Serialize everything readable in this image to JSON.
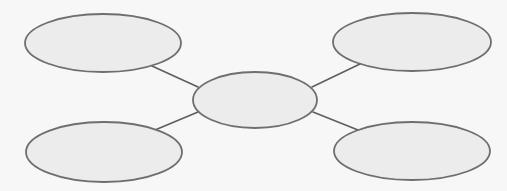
{
  "diagram": {
    "type": "spider-map",
    "colors": {
      "background": "#f7f7f7",
      "node_fill": "#ececec",
      "node_stroke": "#6e6e6e",
      "edge_stroke": "#5e5e5e"
    },
    "nodes": [
      {
        "id": "center",
        "label": "",
        "cx": 255,
        "cy": 100,
        "rx": 62,
        "ry": 28
      },
      {
        "id": "top-left",
        "label": "",
        "cx": 103,
        "cy": 43,
        "rx": 78,
        "ry": 29
      },
      {
        "id": "top-right",
        "label": "",
        "cx": 412,
        "cy": 42,
        "rx": 79,
        "ry": 29
      },
      {
        "id": "bottom-left",
        "label": "",
        "cx": 104,
        "cy": 152,
        "rx": 78,
        "ry": 30
      },
      {
        "id": "bottom-right",
        "label": "",
        "cx": 412,
        "cy": 151,
        "rx": 78,
        "ry": 29
      }
    ],
    "edges": [
      {
        "from": "center",
        "to": "top-left",
        "x1": 198,
        "y1": 87,
        "x2": 152,
        "y2": 66
      },
      {
        "from": "center",
        "to": "top-right",
        "x1": 312,
        "y1": 87,
        "x2": 360,
        "y2": 64
      },
      {
        "from": "center",
        "to": "bottom-left",
        "x1": 198,
        "y1": 112,
        "x2": 155,
        "y2": 130
      },
      {
        "from": "center",
        "to": "bottom-right",
        "x1": 313,
        "y1": 112,
        "x2": 358,
        "y2": 130
      }
    ]
  }
}
